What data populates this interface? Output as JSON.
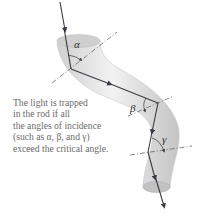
{
  "figure": {
    "caption_lines": [
      "The light is trapped",
      "in the rod if all",
      "the angles of incidence",
      "(such as α, β, and γ)",
      "exceed the critical angle."
    ],
    "angle_labels": {
      "alpha": "α",
      "beta": "β",
      "gamma": "γ"
    },
    "colors": {
      "rod_light": "#ececec",
      "rod_mid": "#d2d2d2",
      "rod_dark": "#b5b5b5",
      "ray": "#3a3a44",
      "normal_line": "#555555",
      "caption_text": "#6b6b6b"
    }
  }
}
